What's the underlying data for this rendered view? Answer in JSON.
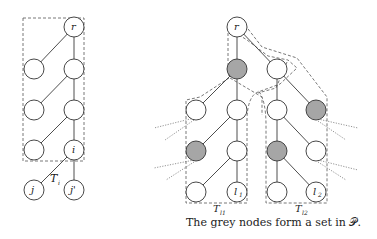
{
  "figure": {
    "left_tree": {
      "root_label": "r",
      "i_label": "i",
      "child_labels": [
        "j",
        "j'"
      ],
      "subtree_label": "T",
      "subtree_subscript": "i"
    },
    "right_tree": {
      "root_label": "r",
      "leaf_labels": [
        "l",
        "l"
      ],
      "leaf_subscripts": [
        "1",
        "2"
      ],
      "subtree_labels": [
        "T",
        "T"
      ],
      "subtree_subscripts": [
        "l1",
        "l2"
      ],
      "caption": "The grey nodes form a set in 𝒫."
    },
    "colors": {
      "grey_node": "#a6a6a6",
      "white_node": "#ffffff",
      "line": "#3a3a3a"
    }
  }
}
